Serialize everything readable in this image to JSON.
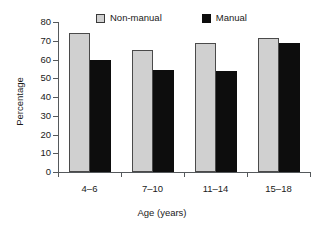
{
  "chart_data": {
    "type": "bar",
    "title": "",
    "subtitle": "",
    "xlabel": "Age (years)",
    "ylabel": "Percentage",
    "categories": [
      "4–6",
      "7–10",
      "11–14",
      "15–18"
    ],
    "series": [
      {
        "name": "Non-manual",
        "color": "#d0d0d0",
        "values": [
          74,
          65,
          69,
          71.5
        ]
      },
      {
        "name": "Manual",
        "color": "#0d0d0d",
        "values": [
          60,
          54.5,
          54,
          69
        ]
      }
    ],
    "ylim": [
      0,
      80
    ],
    "yticks": [
      0,
      10,
      20,
      30,
      40,
      50,
      60,
      70,
      80
    ],
    "yticklabels": [
      "0",
      "10",
      "20",
      "30",
      "40",
      "50",
      "60",
      "70",
      "80"
    ],
    "grid": false,
    "legend_position": "top-center",
    "legend": [
      {
        "label": "Non-manual",
        "swatch": "light-gray"
      },
      {
        "label": "Manual",
        "swatch": "black"
      }
    ]
  },
  "colors": {
    "nonmanual": "#d0d0d0",
    "manual": "#0d0d0d",
    "axis": "#55595c",
    "text": "#1a1a1a",
    "background": "#ffffff"
  }
}
